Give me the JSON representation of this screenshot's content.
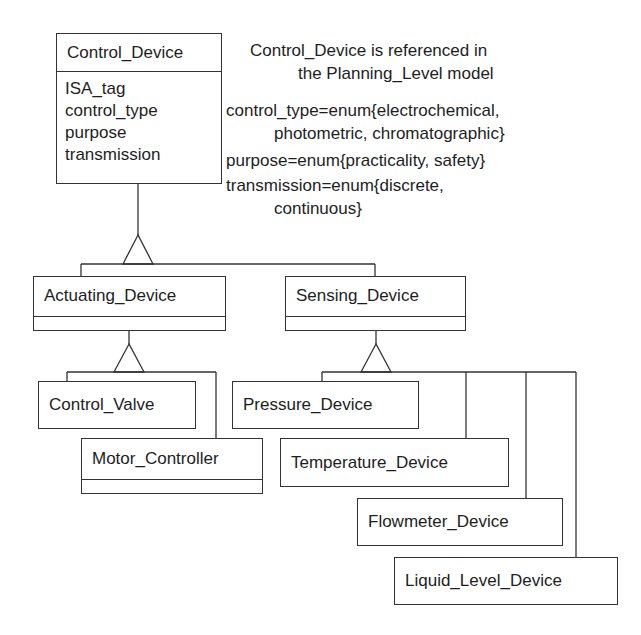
{
  "diagram": {
    "type": "class-hierarchy",
    "root_class": {
      "name": "Control_Device",
      "attributes": [
        "ISA_tag",
        "control_type",
        "purpose",
        "transmission"
      ]
    },
    "notes": {
      "reference": [
        "Control_Device is referenced in",
        "the Planning_Level model"
      ],
      "control_type": [
        "control_type=enum{electrochemical,",
        "photometric, chromatographic}"
      ],
      "purpose": [
        "purpose=enum{practicality, safety}"
      ],
      "transmission": [
        "transmission=enum{discrete,",
        "continuous}"
      ]
    },
    "subclasses": [
      {
        "name": "Actuating_Device",
        "subclasses": [
          {
            "name": "Control_Valve"
          },
          {
            "name": "Motor_Controller"
          }
        ]
      },
      {
        "name": "Sensing_Device",
        "subclasses": [
          {
            "name": "Pressure_Device"
          },
          {
            "name": "Temperature_Device"
          },
          {
            "name": "Flowmeter_Device"
          },
          {
            "name": "Liquid_Level_Device"
          }
        ]
      }
    ],
    "colors": {
      "line": "#333333",
      "text": "#1e1e1e",
      "background": "#ffffff"
    }
  }
}
